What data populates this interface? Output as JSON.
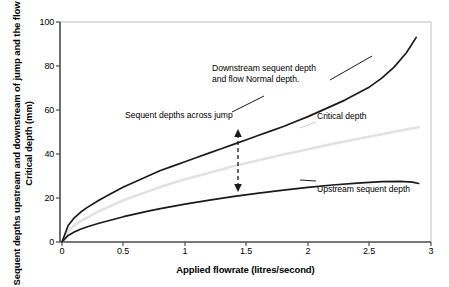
{
  "chart_data": {
    "type": "line",
    "title": "",
    "xlabel": "Applied flowrate (litres/second)",
    "ylabel": "Sequent depths upstream and downstream of jump and the flow Critical depth (mm)",
    "xlim": [
      0,
      3
    ],
    "ylim": [
      0,
      100
    ],
    "xticks": [
      "0",
      "0.5",
      "1",
      "1.5",
      "2",
      "2.5",
      "3"
    ],
    "xtick_values": [
      0,
      0.5,
      1,
      1.5,
      2,
      2.5,
      3
    ],
    "yticks": [
      "0",
      "20",
      "40",
      "60",
      "80",
      "100"
    ],
    "ytick_values": [
      0,
      20,
      40,
      60,
      80,
      100
    ],
    "grid": false,
    "legend_position": "inline-annotations",
    "series": [
      {
        "name": "Downstream sequent depth and flow Normal depth",
        "color": "#1a1a1a",
        "x": [
          0,
          0.05,
          0.1,
          0.15,
          0.2,
          0.3,
          0.4,
          0.5,
          0.6,
          0.7,
          0.8,
          0.9,
          1.0,
          1.1,
          1.2,
          1.3,
          1.4,
          1.5,
          1.6,
          1.7,
          1.8,
          1.9,
          2.0,
          2.1,
          2.2,
          2.3,
          2.4,
          2.5,
          2.6,
          2.7,
          2.8,
          2.88
        ],
        "y": [
          0,
          7.5,
          11.0,
          13.5,
          15.5,
          19.0,
          22.0,
          25.0,
          27.5,
          30.0,
          32.5,
          34.5,
          36.5,
          38.5,
          40.5,
          42.5,
          44.5,
          46.5,
          48.5,
          50.5,
          52.5,
          54.8,
          57.0,
          59.5,
          62.0,
          64.5,
          67.5,
          70.5,
          74.5,
          79.5,
          86.0,
          93.0
        ]
      },
      {
        "name": "Critical depth",
        "color": "#e2e2e2",
        "x": [
          0,
          0.05,
          0.1,
          0.15,
          0.2,
          0.3,
          0.4,
          0.5,
          0.6,
          0.7,
          0.8,
          0.9,
          1.0,
          1.2,
          1.4,
          1.6,
          1.8,
          2.0,
          2.2,
          2.4,
          2.6,
          2.8,
          2.9
        ],
        "y": [
          0,
          5.0,
          7.5,
          9.5,
          11.0,
          14.0,
          16.5,
          19.0,
          21.0,
          23.0,
          25.0,
          26.8,
          28.5,
          31.5,
          34.5,
          37.2,
          39.8,
          42.2,
          44.6,
          46.8,
          49.0,
          51.2,
          52.2
        ]
      },
      {
        "name": "Upstream sequent depth",
        "color": "#1a1a1a",
        "x": [
          0,
          0.05,
          0.1,
          0.15,
          0.2,
          0.3,
          0.4,
          0.5,
          0.6,
          0.7,
          0.8,
          0.9,
          1.0,
          1.2,
          1.4,
          1.6,
          1.8,
          2.0,
          2.2,
          2.4,
          2.6,
          2.75,
          2.85,
          2.9
        ],
        "y": [
          0,
          3.0,
          4.5,
          5.8,
          6.8,
          8.5,
          10.0,
          11.5,
          12.8,
          14.0,
          15.2,
          16.2,
          17.2,
          19.0,
          20.7,
          22.2,
          23.6,
          24.8,
          25.9,
          26.8,
          27.4,
          27.6,
          27.2,
          26.6
        ]
      }
    ],
    "annotations": [
      {
        "id": "downstream-label",
        "text_line1": "Downstream sequent depth",
        "text_line2": "and flow Normal depth."
      },
      {
        "id": "sequent-depths-label",
        "text": "Sequent depths across jump"
      },
      {
        "id": "critical-depth-label",
        "text": "Critical depth"
      },
      {
        "id": "upstream-label",
        "text": "Upstream sequent depth"
      },
      {
        "id": "jump-arrow",
        "text": "",
        "x": 1.45,
        "y_top": 50.5,
        "y_bottom": 23.6,
        "style": "dashed-double-arrow"
      }
    ]
  },
  "colors": {
    "axis": "#555555",
    "frame": "#b8b8b8",
    "dark_curve": "#1a1a1a",
    "light_curve": "#e2e2e2",
    "text": "#000000",
    "background": "#ffffff"
  }
}
